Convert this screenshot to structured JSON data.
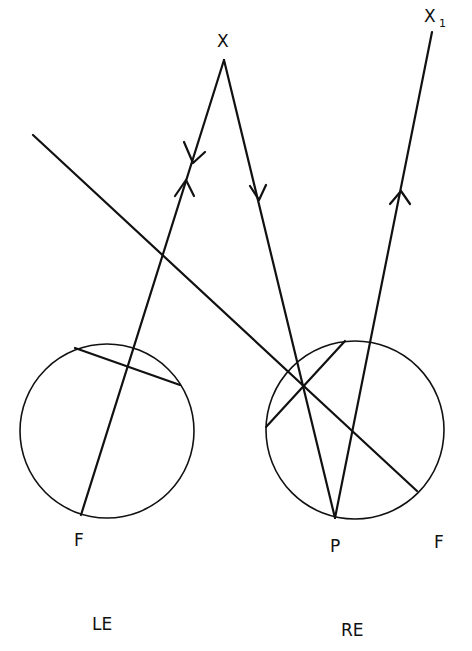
{
  "diagram": {
    "type": "optics-ray-diagram",
    "labels": {
      "x": "X",
      "x1_main": "X",
      "x1_sub": "1",
      "left_f": "F",
      "right_f": "F",
      "p": "P",
      "left_eye": "LE",
      "right_eye": "RE"
    },
    "colors": {
      "line": "#111111",
      "background": "#ffffff"
    },
    "eyes": [
      {
        "name": "left-eye",
        "label": "LE",
        "center": [
          107,
          431
        ],
        "radius": 87
      },
      {
        "name": "right-eye",
        "label": "RE",
        "center": [
          355,
          430
        ],
        "radius": 89
      }
    ],
    "points": {
      "X": [
        224,
        60
      ],
      "X1": [
        432,
        32
      ],
      "P": [
        335,
        518
      ],
      "left_F": [
        81,
        515
      ],
      "right_F": [
        417,
        491
      ]
    }
  }
}
